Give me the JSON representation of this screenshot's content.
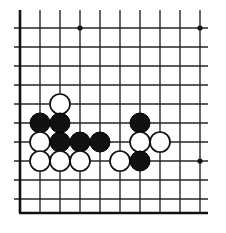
{
  "figure": {
    "kind": "go-board-diagram",
    "width": 226,
    "height": 233,
    "background_color": "#ffffff"
  },
  "board": {
    "line_color": "#262626",
    "edge_color": "#111111",
    "grid_spacing": 19,
    "origin_x": 20,
    "origin_y": 28,
    "columns": 10,
    "rows": 10,
    "vertical_line_x": [
      20,
      40,
      60,
      80,
      100,
      120,
      140,
      160,
      180,
      200
    ],
    "horizontal_line_y": [
      28,
      47,
      66,
      85,
      104,
      123,
      142,
      161,
      180,
      199
    ],
    "vertical_line_top": 10,
    "vertical_line_bottom": 213,
    "horizontal_line_left": 14,
    "horizontal_line_right": 208,
    "left_edge_x": 20,
    "bottom_edge_y": 213,
    "star_points": [
      {
        "x": 80,
        "y": 28,
        "r": 2.6
      },
      {
        "x": 200,
        "y": 28,
        "r": 2.6
      },
      {
        "x": 200,
        "y": 161,
        "r": 2.6
      }
    ]
  },
  "stones": {
    "radius": 10,
    "black_color": "#111111",
    "white_color": "#ffffff",
    "white_outline_color": "#111111",
    "black_count": 8,
    "white_count": 9,
    "list": [
      {
        "color": "white",
        "x": 60,
        "y": 104
      },
      {
        "color": "black",
        "x": 40,
        "y": 123
      },
      {
        "color": "black",
        "x": 60,
        "y": 123
      },
      {
        "color": "black",
        "x": 140,
        "y": 123
      },
      {
        "color": "white",
        "x": 40,
        "y": 142
      },
      {
        "color": "black",
        "x": 60,
        "y": 142
      },
      {
        "color": "black",
        "x": 80,
        "y": 142
      },
      {
        "color": "black",
        "x": 100,
        "y": 142
      },
      {
        "color": "white",
        "x": 140,
        "y": 142
      },
      {
        "color": "white",
        "x": 160,
        "y": 142
      },
      {
        "color": "white",
        "x": 40,
        "y": 161
      },
      {
        "color": "white",
        "x": 60,
        "y": 161
      },
      {
        "color": "white",
        "x": 80,
        "y": 161
      },
      {
        "color": "white",
        "x": 120,
        "y": 161
      },
      {
        "color": "black",
        "x": 140,
        "y": 161
      }
    ]
  }
}
